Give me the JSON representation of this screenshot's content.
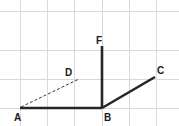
{
  "figure": {
    "type": "geometry-diagram",
    "width": 179,
    "height": 126,
    "background_color": "#ffffff",
    "grid": {
      "visible": true,
      "color": "#d9d9dd",
      "stroke_width": 1,
      "vertical_x": [
        20,
        47,
        74,
        102,
        129,
        156
      ],
      "horizontal_y": [
        11,
        50,
        79,
        108
      ]
    },
    "points": [
      {
        "id": "A",
        "label": "A",
        "x": 20,
        "y": 108,
        "label_x": 14,
        "label_y": 121
      },
      {
        "id": "B",
        "label": "B",
        "x": 102,
        "y": 108,
        "label_x": 104,
        "label_y": 121
      },
      {
        "id": "C",
        "label": "C",
        "x": 155,
        "y": 77,
        "label_x": 157,
        "label_y": 74
      },
      {
        "id": "D",
        "label": "D",
        "x": 78,
        "y": 79,
        "label_x": 65,
        "label_y": 76
      },
      {
        "id": "F",
        "label": "F",
        "x": 102,
        "y": 46,
        "label_x": 96,
        "label_y": 44
      }
    ],
    "segments": [
      {
        "id": "AB",
        "from": "A",
        "to": "B",
        "x1": 20,
        "y1": 108,
        "x2": 102,
        "y2": 108,
        "style": "solid",
        "color": "#262626",
        "stroke_width": 2.6
      },
      {
        "id": "BF",
        "from": "B",
        "to": "F",
        "x1": 102,
        "y1": 108,
        "x2": 102,
        "y2": 46,
        "style": "solid",
        "color": "#262626",
        "stroke_width": 2.6
      },
      {
        "id": "BC",
        "from": "B",
        "to": "C",
        "x1": 102,
        "y1": 108,
        "x2": 155,
        "y2": 77,
        "style": "solid",
        "color": "#262626",
        "stroke_width": 2.6
      },
      {
        "id": "AD",
        "from": "A",
        "to": "D",
        "x1": 21,
        "y1": 107,
        "x2": 79,
        "y2": 79,
        "style": "dashed",
        "color": "#3a3a3a",
        "stroke_width": 1,
        "dash_pattern": "3,2"
      }
    ],
    "label_color": "#1a1a1a",
    "label_font_size": "10px"
  }
}
